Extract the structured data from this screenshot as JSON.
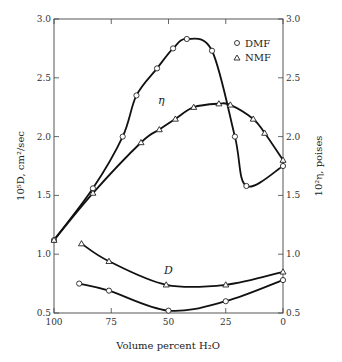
{
  "chart_data": {
    "type": "line",
    "title": "",
    "xlabel": "Volume percent H2O",
    "ylabel_left": "10^5 D, cm^2/sec",
    "ylabel_right": "10^2 η, poises",
    "xlim": [
      100,
      0
    ],
    "ylim": [
      0.5,
      3.0
    ],
    "x_ticks": [
      "100",
      "75",
      "50",
      "25",
      "0"
    ],
    "y_ticks_left": [
      "0.5",
      "1.0",
      "1.5",
      "2.0",
      "2.5",
      "3.0"
    ],
    "y_ticks_right": [
      "0.5",
      "1.0",
      "1.5",
      "2.0",
      "2.5",
      "3.0"
    ],
    "legend": [
      {
        "marker": "circle",
        "label": "DMF"
      },
      {
        "marker": "triangle",
        "label": "NMF"
      }
    ],
    "annotations": [
      "η",
      "D"
    ],
    "series": [
      {
        "name": "η DMF",
        "marker": "circle",
        "x": [
          100,
          83,
          70,
          64,
          55,
          48,
          42,
          31,
          21,
          16,
          0
        ],
        "values": [
          1.12,
          1.56,
          2.0,
          2.35,
          2.58,
          2.75,
          2.83,
          2.73,
          2.0,
          1.58,
          1.75
        ]
      },
      {
        "name": "η NMF",
        "marker": "triangle",
        "x": [
          100,
          83,
          62,
          54,
          47,
          39,
          28,
          23,
          13,
          8,
          0
        ],
        "values": [
          1.12,
          1.52,
          1.95,
          2.06,
          2.15,
          2.25,
          2.28,
          2.27,
          2.15,
          2.03,
          1.8
        ]
      },
      {
        "name": "D NMF",
        "marker": "triangle",
        "x": [
          88,
          76,
          51,
          25,
          0
        ],
        "values": [
          1.09,
          0.94,
          0.74,
          0.74,
          0.85
        ]
      },
      {
        "name": "D DMF",
        "marker": "circle",
        "x": [
          89,
          76,
          50,
          25,
          0
        ],
        "values": [
          0.75,
          0.69,
          0.52,
          0.6,
          0.78
        ]
      }
    ],
    "grid": false,
    "legend_position": "top-right"
  },
  "labels": {
    "xlabel": "Volume percent H₂O",
    "ylabel_left": "10⁵D, cm²/sec",
    "ylabel_right": "10²η, poises",
    "legend_dmf": "DMF",
    "legend_nmf": "NMF",
    "eta": "η",
    "d": "D"
  }
}
